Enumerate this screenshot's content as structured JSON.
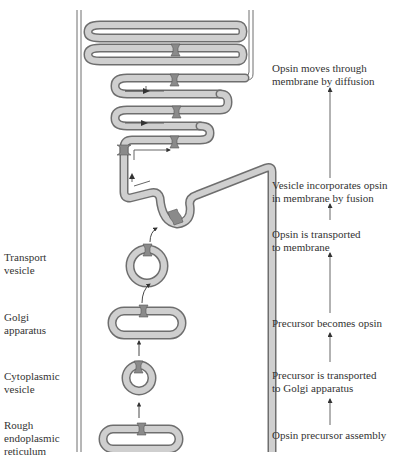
{
  "diagram": {
    "title": "",
    "colors": {
      "membrane_fill": "#c9c9c9",
      "membrane_stroke": "#6e6e6e",
      "opsin_fill": "#8a8a8a",
      "arrow": "#333333",
      "flow_arrow": "#666666"
    },
    "left_labels": [
      {
        "id": "transport-vesicle",
        "line1": "Transport",
        "line2": "vesicle"
      },
      {
        "id": "golgi-apparatus",
        "line1": "Golgi",
        "line2": "apparatus"
      },
      {
        "id": "cytoplasmic-vesicle",
        "line1": "Cytoplasmic",
        "line2": "vesicle"
      },
      {
        "id": "rough-er",
        "line1": "Rough",
        "line2": "endoplasmic",
        "line3": "reticulum"
      }
    ],
    "right_steps": [
      {
        "id": "step-6",
        "line1": "Opsin moves through",
        "line2": "membrane by diffusion"
      },
      {
        "id": "step-5",
        "line1": "Vesicle incorporates opsin",
        "line2": "in membrane by fusion"
      },
      {
        "id": "step-4",
        "line1": "Opsin is transported",
        "line2": "to membrane"
      },
      {
        "id": "step-3",
        "line1": "Precursor becomes opsin"
      },
      {
        "id": "step-2",
        "line1": "Precursor is transported",
        "line2": "to Golgi apparatus"
      },
      {
        "id": "step-1",
        "line1": "Opsin precursor assembly"
      }
    ]
  }
}
